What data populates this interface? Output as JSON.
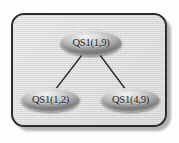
{
  "diagram": {
    "frame": {
      "border_color": "#2b2b2b",
      "fill_color": "#dcdcdc",
      "shadow_color": "#9a9a9a"
    },
    "node_style": {
      "fill_light": "#f2f2f2",
      "fill_dark": "#7d7d7d",
      "text_color": "#1c1c1c"
    },
    "edge_color": "#2e2e2e",
    "nodes": [
      {
        "id": "root",
        "label": "QS1(1,9)"
      },
      {
        "id": "left",
        "label": "QS1(1,2)"
      },
      {
        "id": "right",
        "label": "QS1(4,9)"
      }
    ],
    "edges": [
      {
        "from": "root",
        "to": "left"
      },
      {
        "from": "root",
        "to": "right"
      }
    ]
  }
}
